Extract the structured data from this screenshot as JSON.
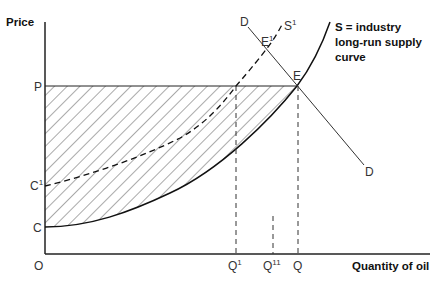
{
  "diagram": {
    "y_axis_label": "Price",
    "x_axis_label": "Quantity of oil",
    "origin_label": "O",
    "price_labels": {
      "P": "P",
      "C1": "C",
      "C1_sup": "1",
      "C": "C"
    },
    "quantity_labels": {
      "Q1": "Q",
      "Q1_sup": "1",
      "Q11": "Q",
      "Q11_sup": "11",
      "Q": "Q"
    },
    "curves": {
      "demand_top": "D",
      "demand_bottom": "D",
      "supply_shifted": "S",
      "supply_shifted_sup": "1",
      "equilibrium": "E",
      "equilibrium_shifted": "E",
      "equilibrium_shifted_sup": "1"
    },
    "supply_caption": [
      "S = industry",
      "long-run supply",
      "curve"
    ],
    "colors": {
      "line": "#222222",
      "hatch": "#555555",
      "text": "#333333"
    }
  }
}
